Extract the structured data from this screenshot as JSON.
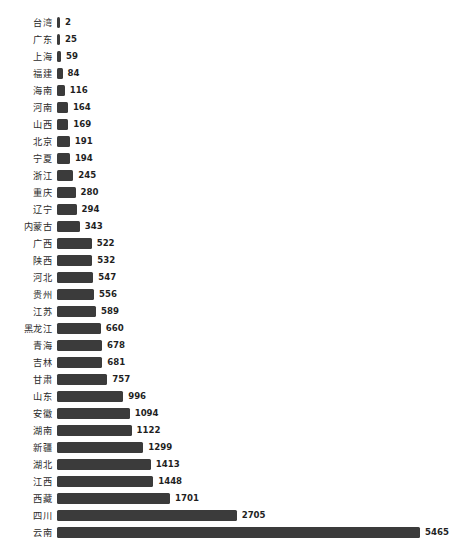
{
  "chart_data": {
    "type": "bar",
    "orientation": "horizontal",
    "title": "",
    "subtitle": "",
    "xlabel": "",
    "ylabel": "",
    "grid": false,
    "legend": null,
    "legend_position": "none",
    "axis_visible": false,
    "xlim": [
      0,
      5465
    ],
    "bar_color": "#3b3b3b",
    "label_color": "#2b2b2b",
    "value_color": "#1f1f1f",
    "value_labels_shown": true,
    "sort_order": "ascending",
    "categories": [
      "台湾",
      "广东",
      "上海",
      "福建",
      "海南",
      "河南",
      "山西",
      "北京",
      "宁夏",
      "浙江",
      "重庆",
      "辽宁",
      "内蒙古",
      "广西",
      "陕西",
      "河北",
      "贵州",
      "江苏",
      "黑龙江",
      "青海",
      "吉林",
      "甘肃",
      "山东",
      "安徽",
      "湖南",
      "新疆",
      "湖北",
      "江西",
      "西藏",
      "四川",
      "云南"
    ],
    "values": [
      2,
      25,
      59,
      84,
      116,
      164,
      169,
      191,
      194,
      245,
      280,
      294,
      343,
      522,
      532,
      547,
      556,
      589,
      660,
      678,
      681,
      757,
      996,
      1094,
      1122,
      1299,
      1413,
      1448,
      1701,
      2705,
      5465
    ],
    "value_texts": [
      "2",
      "25",
      "59",
      "84",
      "116",
      "164",
      "169",
      "191",
      "194",
      "245",
      "280",
      "294",
      "343",
      "522",
      "532",
      "547",
      "556",
      "589",
      "660",
      "678",
      "681",
      "757",
      "996",
      "1094",
      "1122",
      "1299",
      "1413",
      "1448",
      "1701",
      "2705",
      "5465"
    ]
  }
}
